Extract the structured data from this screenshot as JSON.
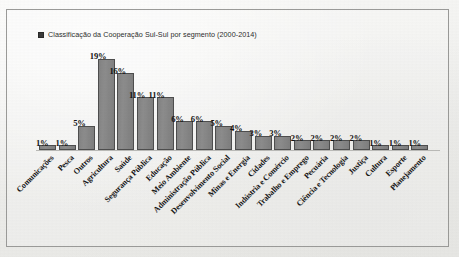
{
  "figure": {
    "legend_label": "Classificação da Cooperação Sul-Sul por segmento (2000-2014)",
    "legend_marker": "legend-swatch-dark",
    "border_color": "#9a9a98",
    "bar_fill_color": "#868686",
    "bar_border_color": "#4e4e4e",
    "background_color": "#f1f1ef",
    "value_suffix": "%"
  },
  "chart_data": {
    "type": "bar",
    "title": "Classificação da Cooperação Sul-Sul por segmento (2000-2014)",
    "xlabel": "",
    "ylabel": "",
    "ylim": [
      0,
      20
    ],
    "grid": false,
    "legend_position": "top-left",
    "categories": [
      "Comunicações",
      "Pesca",
      "Outros",
      "Agricultura",
      "Saúde",
      "Segurança Pública",
      "Educação",
      "Meio Ambiente",
      "Administração Pública",
      "Desenvolvimento Social",
      "Minas e Energia",
      "Cidades",
      "Indústria e Comércio",
      "Trabalho e Emprego",
      "Pecuária",
      "Ciência e Tecnologia",
      "Justiça",
      "Cultura",
      "Esporte",
      "Planejamento"
    ],
    "values": [
      1,
      1,
      5,
      19,
      16,
      11,
      11,
      6,
      6,
      5,
      4,
      3,
      3,
      2,
      2,
      2,
      2,
      1,
      1,
      1
    ],
    "value_labels": [
      "1%",
      "1%",
      "5%",
      "19%",
      "16%",
      "11%",
      "11%",
      "6%",
      "6%",
      "5%",
      "4%",
      "3%",
      "3%",
      "2%",
      "2%",
      "2%",
      "2%",
      "1%",
      "1%",
      "1%"
    ]
  }
}
